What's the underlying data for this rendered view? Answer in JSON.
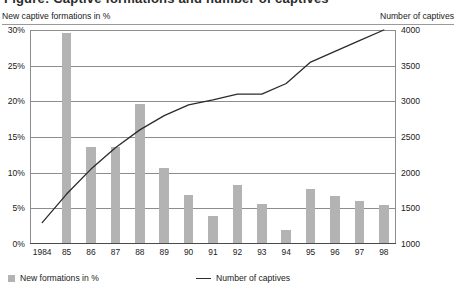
{
  "title_partial": "Figure: Captive formations and number of captives",
  "axes": {
    "left_caption": "New captive formations in %",
    "right_caption": "Number of captives"
  },
  "legend": {
    "bars_label": "New formations in %",
    "line_label": "Number of captives",
    "bar_swatch": "bar-swatch",
    "line_swatch": "line-swatch"
  },
  "colors": {
    "bar": "#b3b3b3",
    "line": "#2b2b2b",
    "grid": "#8d8d8d",
    "text": "#1a1a1a"
  },
  "chart_data": {
    "type": "bar",
    "title": "",
    "xlabel": "",
    "ylabel": "New captive formations in %",
    "y2label": "Number of captives",
    "grid": true,
    "legend_position": "bottom",
    "categories": [
      "1984",
      "85",
      "86",
      "87",
      "88",
      "89",
      "90",
      "91",
      "92",
      "93",
      "94",
      "95",
      "96",
      "97",
      "98"
    ],
    "ylim": [
      0,
      30
    ],
    "yticks": [
      0,
      5,
      10,
      15,
      20,
      25,
      30
    ],
    "ytick_labels": [
      "0%",
      "5%",
      "10%",
      "15%",
      "20%",
      "25%",
      "30%"
    ],
    "y2lim": [
      1000,
      4000
    ],
    "y2ticks": [
      1000,
      1500,
      2000,
      2500,
      3000,
      3500,
      4000
    ],
    "y2tick_labels": [
      "1000",
      "1500",
      "2000",
      "2500",
      "3000",
      "3500",
      "4000"
    ],
    "series": [
      {
        "name": "New formations in %",
        "type": "bar",
        "axis": "left",
        "values": [
          0,
          29.5,
          13.5,
          13.4,
          19.5,
          10.5,
          6.8,
          3.8,
          8.2,
          5.5,
          1.8,
          7.6,
          6.6,
          5.9,
          5.3
        ]
      },
      {
        "name": "Number of captives",
        "type": "line",
        "axis": "right",
        "values": [
          1300,
          1700,
          2050,
          2350,
          2600,
          2800,
          2950,
          3020,
          3100,
          3100,
          3250,
          3550,
          3700,
          3850,
          4000
        ]
      }
    ]
  }
}
